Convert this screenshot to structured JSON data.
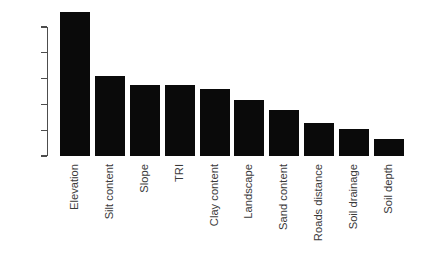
{
  "chart_data": {
    "type": "bar",
    "title": "",
    "subtitle": "",
    "xlabel": "",
    "ylabel": "",
    "categories": [
      "Elevation",
      "Silt content",
      "Slope",
      "TRI",
      "Clay content",
      "Landscape",
      "Sand content",
      "Roads distance",
      "Soil drainage",
      "Soil depth"
    ],
    "values": [
      28.0,
      15.5,
      13.7,
      13.7,
      12.9,
      10.8,
      8.9,
      6.4,
      5.2,
      3.3
    ],
    "ylim": [
      0,
      28.6
    ],
    "yticks": [
      0,
      5,
      10,
      15,
      20,
      25
    ],
    "ytick_labels": [
      "0",
      "5",
      "10",
      "15",
      "20",
      "25"
    ],
    "grid": false,
    "legend": null,
    "bar_color": "#0a0a0a",
    "axis_color": "#4d4d4d",
    "text_color": "#3a3a3a",
    "background_color": "#ffffff",
    "xtick_rotation": 90
  }
}
